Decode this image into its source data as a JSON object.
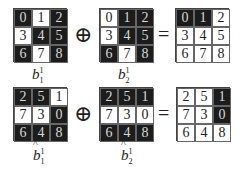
{
  "rows": [
    {
      "grids": [
        {
          "id": "b1",
          "cells": [
            "0",
            "1",
            "2",
            "3",
            "4",
            "5",
            "6",
            "7",
            "8"
          ],
          "dark": [
            true,
            false,
            true,
            false,
            true,
            true,
            true,
            false,
            true
          ],
          "label": {
            "base": "b",
            "sub": "1",
            "sup": "1",
            "hat": false
          }
        },
        {
          "id": "b2",
          "cells": [
            "0",
            "1",
            "2",
            "3",
            "4",
            "5",
            "6",
            "7",
            "8"
          ],
          "dark": [
            false,
            true,
            true,
            false,
            true,
            true,
            true,
            false,
            true
          ],
          "label": {
            "base": "b",
            "sub": "2",
            "sup": "1",
            "hat": false
          }
        },
        {
          "id": "result1",
          "cells": [
            "0",
            "1",
            "2",
            "3",
            "4",
            "5",
            "6",
            "7",
            "8"
          ],
          "dark": [
            true,
            true,
            false,
            false,
            false,
            false,
            false,
            false,
            false
          ],
          "label": null
        }
      ],
      "operator": "⊕",
      "equals": "="
    },
    {
      "grids": [
        {
          "id": "bhat1",
          "cells": [
            "2",
            "5",
            "1",
            "7",
            "3",
            "0",
            "6",
            "4",
            "8"
          ],
          "dark": [
            true,
            true,
            false,
            false,
            false,
            true,
            true,
            true,
            true
          ],
          "label": {
            "base": "b",
            "sub": "1",
            "sup": "1",
            "hat": true
          }
        },
        {
          "id": "bhat2",
          "cells": [
            "2",
            "5",
            "1",
            "7",
            "3",
            "0",
            "6",
            "4",
            "8"
          ],
          "dark": [
            true,
            true,
            true,
            false,
            false,
            false,
            true,
            true,
            true
          ],
          "label": {
            "base": "b",
            "sub": "2",
            "sup": "1",
            "hat": true
          }
        },
        {
          "id": "result2",
          "cells": [
            "2",
            "5",
            "1",
            "7",
            "3",
            "0",
            "6",
            "4",
            "8"
          ],
          "dark": [
            false,
            false,
            true,
            false,
            false,
            true,
            false,
            false,
            false
          ],
          "label": null
        }
      ],
      "operator": "⊕",
      "equals": "="
    }
  ],
  "colors": {
    "dark_cell": "#1c1c1c",
    "light_cell": "#ffffff",
    "dark_text": "#d8d8d8",
    "light_text": "#222222"
  }
}
